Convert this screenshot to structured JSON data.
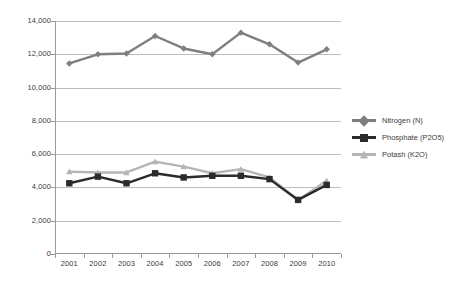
{
  "chart_data": {
    "type": "line",
    "title": "",
    "subtitle": "",
    "xlabel": "",
    "ylabel": "",
    "categories": [
      "2001",
      "2002",
      "2003",
      "2004",
      "2005",
      "2006",
      "2007",
      "2008",
      "2009",
      "2010"
    ],
    "ylim": [
      0,
      14000
    ],
    "ytick_values": [
      0,
      2000,
      4000,
      6000,
      8000,
      10000,
      12000,
      14000
    ],
    "ytick_labels": [
      "0",
      "2,000",
      "4,000",
      "6,000",
      "8,000",
      "10,000",
      "12,000",
      "14,000"
    ],
    "grid": "horizontal",
    "legend_position": "right",
    "series": [
      {
        "name": "Nitrogen (N)",
        "color": "#7f7f7f",
        "marker": "diamond",
        "values": [
          11450,
          12000,
          12050,
          13100,
          12350,
          12000,
          13300,
          12600,
          11500,
          12300
        ]
      },
      {
        "name": "Phosphate (P2O5)",
        "color": "#2b2b2b",
        "marker": "square",
        "values": [
          4250,
          4650,
          4250,
          4850,
          4600,
          4700,
          4700,
          4500,
          3250,
          4150
        ]
      },
      {
        "name": "Potash (K2O)",
        "color": "#b5b5b5",
        "marker": "triangle",
        "values": [
          4950,
          4900,
          4900,
          5550,
          5250,
          4850,
          5100,
          4600,
          3250,
          4400
        ]
      }
    ]
  },
  "legend": {
    "items": [
      {
        "label": "Nitrogen (N)"
      },
      {
        "label": "Phosphate (P2O5)"
      },
      {
        "label": "Potash (K2O)"
      }
    ]
  },
  "colors": {
    "nitrogen": "#7f7f7f",
    "phosphate": "#2b2b2b",
    "potash": "#b5b5b5",
    "gridline": "#bdbdbd",
    "axis": "#9a9a9a",
    "text": "#3b3b3b",
    "background": "#ffffff"
  }
}
